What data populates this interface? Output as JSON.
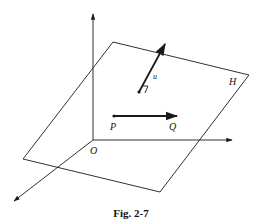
{
  "figure": {
    "caption": "Fig. 2-7",
    "colors": {
      "stroke": "#1a1a1a",
      "background": "#ffffff"
    },
    "labels": {
      "origin": "O",
      "plane": "H",
      "normal_vector": "u",
      "point_p": "P",
      "point_q": "Q"
    },
    "elements": [
      "z-axis (vertical, arrow up)",
      "x-axis (horizontal, arrow right)",
      "y-axis (diagonal toward viewer, arrow down-left)",
      "plane H (parallelogram)",
      "vector u normal to plane with right-angle mark",
      "vector PQ lying in plane"
    ]
  }
}
